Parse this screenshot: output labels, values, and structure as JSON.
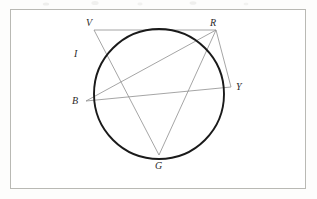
{
  "page": {
    "background_color": "#fdfdfc",
    "frame": {
      "border_color": "#b9b9b4",
      "fill_color": "#ffffff",
      "x": 10,
      "y": 9,
      "width": 296,
      "height": 180
    }
  },
  "figure": {
    "type": "circle-geometry-diagram",
    "circle": {
      "center_x": 159,
      "center_y": 94,
      "radius": 65,
      "stroke_color": "#1a1a1a",
      "stroke_width": 1.9
    },
    "chord_stroke_color": "#8e8e8e",
    "chord_stroke_width": 0.8,
    "points": [
      {
        "id": "V",
        "label": "V",
        "x": 94,
        "y": 30,
        "label_x": 86,
        "label_y": 18,
        "on_circle": true
      },
      {
        "id": "R",
        "label": "R",
        "x": 216,
        "y": 30,
        "label_x": 210,
        "label_y": 18,
        "on_circle": true
      },
      {
        "id": "B",
        "label": "B",
        "x": 86,
        "y": 101,
        "label_x": 72,
        "label_y": 96,
        "on_circle": true
      },
      {
        "id": "Y",
        "label": "Y",
        "x": 231,
        "y": 87,
        "label_x": 236,
        "label_y": 82,
        "on_circle": true
      },
      {
        "id": "G",
        "label": "G",
        "x": 159,
        "y": 155,
        "label_x": 155,
        "label_y": 161,
        "on_circle": true
      }
    ],
    "arc_labels": [
      {
        "id": "I",
        "label": "I",
        "label_x": 74,
        "label_y": 49
      }
    ],
    "chords": [
      {
        "from": "V",
        "to": "R"
      },
      {
        "from": "V",
        "to": "G"
      },
      {
        "from": "R",
        "to": "B"
      },
      {
        "from": "R",
        "to": "G"
      },
      {
        "from": "R",
        "to": "Y"
      },
      {
        "from": "B",
        "to": "Y"
      }
    ]
  }
}
